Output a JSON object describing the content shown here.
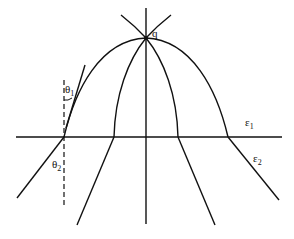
{
  "diagram": {
    "title": "",
    "labels": {
      "point": "q",
      "theta1": "θ",
      "theta1_sub": "1",
      "theta2": "θ",
      "theta2_sub": "2",
      "eps1": "ε",
      "eps1_sub": "1",
      "eps2": "ε",
      "eps2_sub": "2"
    },
    "elements": [
      "vertical axis through q",
      "horizontal interface line between medium ε1 and ε2",
      "outer arc through q refracted at interface",
      "inner arcs through q refracted at interface",
      "tangent line at outer arc with angle θ1",
      "dashed normal at interface with angle θ2"
    ],
    "colors": {
      "stroke": "#111111",
      "background": "#ffffff"
    }
  }
}
